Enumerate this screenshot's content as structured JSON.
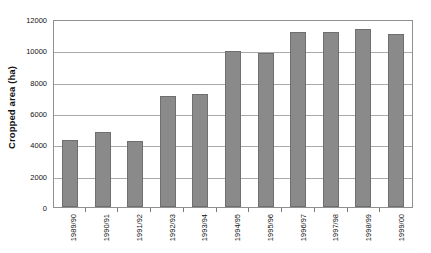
{
  "chart_data": {
    "type": "bar",
    "title": "",
    "xlabel": "",
    "ylabel": "Cropped area (ha)",
    "ylim": [
      0,
      12000
    ],
    "yticks": [
      0,
      2000,
      4000,
      6000,
      8000,
      10000,
      12000
    ],
    "ytick_labels": [
      "0",
      "2000",
      "4000",
      "6000",
      "8000",
      "10000",
      "12000"
    ],
    "grid": true,
    "legend": false,
    "bar_color": "#8a8a8a",
    "bar_edge_color": "#6f6f6f",
    "categories": [
      "1989/90",
      "1990/91",
      "1991/92",
      "1992/93",
      "1993/94",
      "1994/95",
      "1995/96",
      "1996/97",
      "1997/98",
      "1998/99",
      "1999/00"
    ],
    "values": [
      4300,
      4800,
      4200,
      7100,
      7200,
      9950,
      9850,
      11150,
      11150,
      11350,
      11050
    ]
  }
}
